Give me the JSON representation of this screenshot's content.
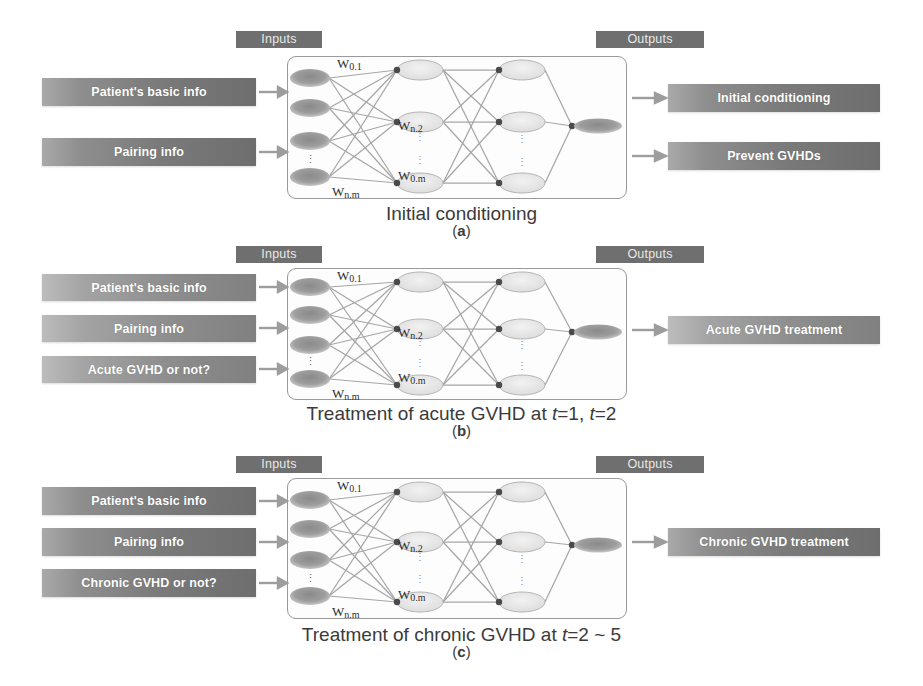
{
  "figure": {
    "section_labels": {
      "inputs": "Inputs",
      "outputs": "Outputs"
    }
  },
  "weight_labels": [
    "W0.1",
    "Wn.2",
    "W0.m",
    "Wn.m"
  ],
  "panels": [
    {
      "id": "a",
      "letter": "(a)",
      "letter_plain": "a",
      "caption": "Initial conditioning",
      "caption_plain": "Initial conditioning",
      "inputs_label": "Inputs",
      "outputs_label": "Outputs",
      "inputs": [
        {
          "label": "Patient's basic info"
        },
        {
          "label": "Pairing info"
        }
      ],
      "outputs": [
        {
          "label": "Initial conditioning"
        },
        {
          "label": "Prevent GVHDs"
        }
      ]
    },
    {
      "id": "b",
      "letter": "(b)",
      "letter_plain": "b",
      "caption": "Treatment of acute GVHD at t=1, t=2",
      "caption_prefix": "Treatment of acute GVHD at ",
      "caption_t1": "t",
      "caption_mid": "=1, ",
      "caption_t2": "t",
      "caption_suffix": "=2",
      "inputs_label": "Inputs",
      "outputs_label": "Outputs",
      "inputs": [
        {
          "label": "Patient's basic info"
        },
        {
          "label": "Pairing info"
        },
        {
          "label": "Acute GVHD or not?"
        }
      ],
      "outputs": [
        {
          "label": "Acute GVHD treatment"
        }
      ]
    },
    {
      "id": "c",
      "letter": "(c)",
      "letter_plain": "c",
      "caption": "Treatment of chronic GVHD at t=2 ~ 5",
      "caption_prefix": "Treatment of chronic GVHD at ",
      "caption_t1": "t",
      "caption_suffix": "=2 ~ 5",
      "inputs_label": "Inputs",
      "outputs_label": "Outputs",
      "inputs": [
        {
          "label": "Patient's basic info"
        },
        {
          "label": "Pairing info"
        },
        {
          "label": "Chronic GVHD or not?"
        }
      ],
      "outputs": [
        {
          "label": "Chronic GVHD treatment"
        }
      ]
    }
  ],
  "network": {
    "layers": [
      {
        "name": "input-layer",
        "node_count": 4,
        "has_vertical_dots": true
      },
      {
        "name": "hidden-layer-1",
        "node_count": 3,
        "has_vertical_dots": true
      },
      {
        "name": "hidden-layer-2",
        "node_count": 3,
        "has_vertical_dots": true
      },
      {
        "name": "output-layer",
        "node_count": 1,
        "has_vertical_dots": false
      }
    ],
    "vertical_dots_glyph": "⋮"
  },
  "colors": {
    "chip_bg": "#6f6f6f",
    "chip_text": "#e9e9e9",
    "iobox_dark": "#6e6e6e",
    "iobox_light": "#bcbcbc",
    "iobox_text": "#ffffff",
    "netbox_border": "#9a9a9a",
    "caption_text": "#3b3b3b",
    "node_input_fill": "#8f8f8f",
    "node_hidden_fill": "#e6e6e6",
    "node_output_fill": "#8b8b8b",
    "edge_stroke": "#9d9d9d"
  }
}
